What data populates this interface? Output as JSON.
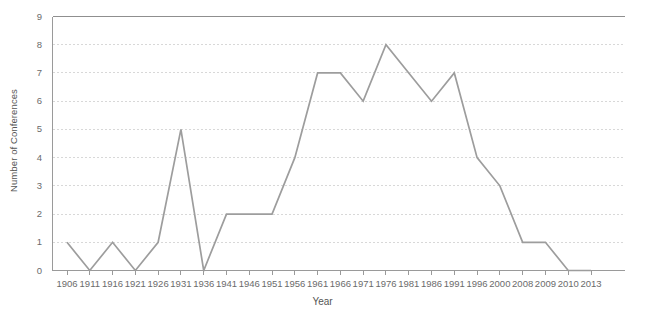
{
  "chart_data": {
    "type": "line",
    "title": "",
    "xlabel": "Year",
    "ylabel": "Number of Conferences",
    "categories": [
      "1906",
      "1911",
      "1916",
      "1921",
      "1926",
      "1931",
      "1936",
      "1941",
      "1946",
      "1951",
      "1956",
      "1961",
      "1966",
      "1971",
      "1976",
      "1981",
      "1986",
      "1991",
      "1996",
      "2000",
      "2008",
      "2009",
      "2010",
      "2013"
    ],
    "values": [
      1,
      0,
      1,
      0,
      1,
      5,
      0,
      2,
      2,
      2,
      4,
      7,
      7,
      6,
      8,
      7,
      6,
      7,
      4,
      3,
      1,
      1,
      0,
      0
    ],
    "series": [
      {
        "name": "Number of Conferences",
        "values": [
          1,
          0,
          1,
          0,
          1,
          5,
          0,
          2,
          2,
          2,
          4,
          7,
          7,
          6,
          8,
          7,
          6,
          7,
          4,
          3,
          1,
          1,
          0,
          0
        ]
      }
    ],
    "x_tick_labels": [
      "1906",
      "1911",
      "1916",
      "1921",
      "1926",
      "1931",
      "1936",
      "1941",
      "1946",
      "1951",
      "1956",
      "1961",
      "1966",
      "1971",
      "1976",
      "1981",
      "1986",
      "1991",
      "1996",
      "2000",
      "2008",
      "2009",
      "2010",
      "2013"
    ],
    "y_tick_labels": [
      "0",
      "1",
      "2",
      "3",
      "4",
      "5",
      "6",
      "7",
      "8",
      "9"
    ],
    "ylim": [
      0,
      9
    ],
    "y_ticks": [
      0,
      1,
      2,
      3,
      4,
      5,
      6,
      7,
      8,
      9
    ],
    "grid": true,
    "grid_axis": "y",
    "legend": false,
    "legend_position": "none",
    "line_color": "#9d9d9d",
    "grid_color": "#d8d8d8",
    "axis_color": "#9a9a9a",
    "text_color": "#6b6b6b",
    "background_color": "#ffffff"
  }
}
